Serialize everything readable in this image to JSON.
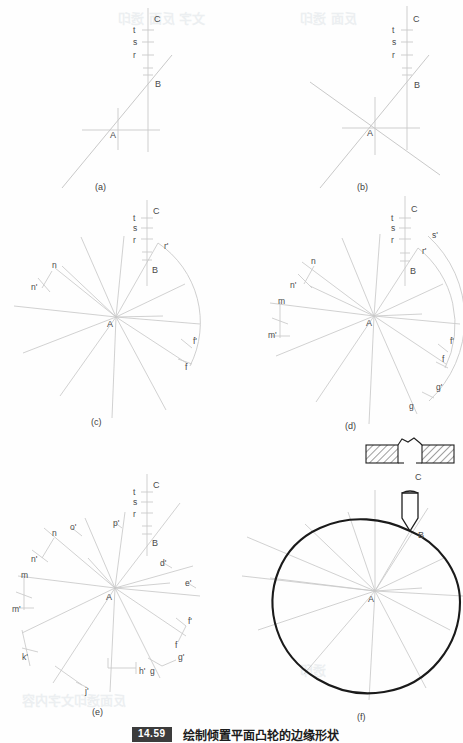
{
  "figure": {
    "number": "14.59",
    "caption": "绘制倾置平面凸轮的边缘形状",
    "panel_labels": [
      "(a)",
      "(b)",
      "(c)",
      "(d)",
      "(e)",
      "(f)"
    ]
  },
  "common_points": {
    "center": "A",
    "vertical_top": "C",
    "vertical_bottom": "B",
    "scale_ticks": [
      "t",
      "s",
      "r"
    ]
  },
  "panels": {
    "a": {
      "label": "(a)",
      "points": [
        "A",
        "B",
        "C"
      ],
      "ticks": [
        "t",
        "s",
        "r"
      ],
      "description": "single oblique line through A meeting vertical axis at B"
    },
    "b": {
      "label": "(b)",
      "points": [
        "A",
        "B",
        "C"
      ],
      "ticks": [
        "t",
        "s",
        "r"
      ],
      "description": "second oblique line added through A"
    },
    "c": {
      "label": "(c)",
      "points": [
        "A",
        "B",
        "C"
      ],
      "ticks": [
        "t",
        "s",
        "r"
      ],
      "arc_labels": [
        "r'",
        "f'",
        "f"
      ],
      "offset_labels": [
        "n",
        "n'"
      ],
      "description": "radial fan of lines from A with arc r' to f"
    },
    "d": {
      "label": "(d)",
      "points": [
        "A",
        "B",
        "C"
      ],
      "ticks": [
        "t",
        "s",
        "r"
      ],
      "arc_labels": [
        "s'",
        "r'",
        "f'",
        "f",
        "g'",
        "g"
      ],
      "offset_labels": [
        "n",
        "n'",
        "m",
        "m'"
      ],
      "description": "two concentric arcs with additional construction offsets"
    },
    "e": {
      "label": "(e)",
      "points": [
        "A",
        "B",
        "C"
      ],
      "ticks": [
        "t",
        "s",
        "r"
      ],
      "arc_labels": [
        "f'",
        "f",
        "g'",
        "g",
        "h'",
        "j'",
        "k'"
      ],
      "offset_labels": [
        "n",
        "n'",
        "m",
        "m'",
        "o'",
        "p'",
        "d'",
        "e'"
      ],
      "description": "full set of transferred points around the centre A"
    },
    "f": {
      "label": "(f)",
      "points": [
        "A",
        "B",
        "C"
      ],
      "description": "finished cam outline drawn as a closed curve with punch and die detail above"
    }
  },
  "tool_detail": {
    "name": "punch-and-die",
    "die_blocks": 2,
    "punch_label_top": "C",
    "punch_tip_label": "B"
  },
  "colors": {
    "construction_line": "#c9c9c9",
    "medium_line": "#b4b4b4",
    "outline": "#1a1a1a",
    "label_text": "#4a4a4a",
    "caption_badge_bg": "#3c3c3c",
    "caption_text": "#1c1c1c",
    "background": "#fefefe"
  }
}
